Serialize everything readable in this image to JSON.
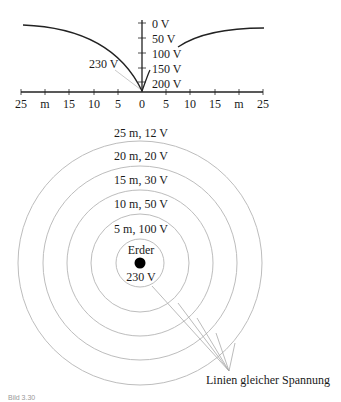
{
  "potential_graph": {
    "voltage_axis_ticks": [
      "0 V",
      "50 V",
      "100 V",
      "150 V",
      "200 V"
    ],
    "distance_axis_ticks_left": [
      "25",
      "m",
      "15",
      "10",
      "5"
    ],
    "center_tick": "0",
    "distance_axis_ticks_right": [
      "5",
      "10",
      "15",
      "m",
      "25"
    ],
    "peak_label": "230 V"
  },
  "equipotential_circles": {
    "rings": [
      {
        "label": "25 m, 12 V"
      },
      {
        "label": "20 m, 20 V"
      },
      {
        "label": "15 m, 30 V"
      },
      {
        "label": "10 m, 50 V"
      },
      {
        "label": "5 m, 100 V"
      }
    ],
    "electrode_label": "Erder",
    "electrode_voltage": "230 V",
    "annotation": "Linien gleicher Spannung"
  },
  "caption": "Bild 3.30"
}
